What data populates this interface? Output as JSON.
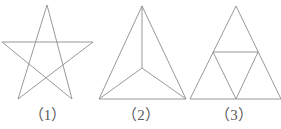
{
  "figure": {
    "background_color": "#ffffff",
    "stroke_color": "#8d8d8d",
    "caption_color": "#5a5a5a",
    "captions": [
      {
        "label": "（1）",
        "name": "caption-1"
      },
      {
        "label": "（2）",
        "name": "caption-2"
      },
      {
        "label": "（3）",
        "name": "caption-3"
      }
    ],
    "shapes": [
      {
        "id": "pentagram",
        "name": "five-pointed-star",
        "description": "five-pointed star drawn as five crossing straight lines (pentagram), unfilled",
        "points": "47,5 18,99 93,42 2,42 72,99 47,5"
      },
      {
        "id": "triangle-center-split",
        "name": "triangle-with-center-point",
        "description": "triangle divided into three parts by segments from an interior point to each vertex",
        "outline": "142,6 186,99 99,99 142,6",
        "center": {
          "x": 142,
          "y": 68
        },
        "spokes": [
          "142,68 142,6",
          "142,68 186,99",
          "142,68 99,99"
        ]
      },
      {
        "id": "triangle-midpoint-split",
        "name": "triangle-with-midsegments",
        "description": "triangle divided into four smaller triangles by joining the midpoints of its three sides",
        "outline": "236,6 281,99 190,99 236,6",
        "midsegments": [
          "213,52 258,52",
          "213,52 236,99",
          "258,52 236,99"
        ]
      }
    ]
  }
}
